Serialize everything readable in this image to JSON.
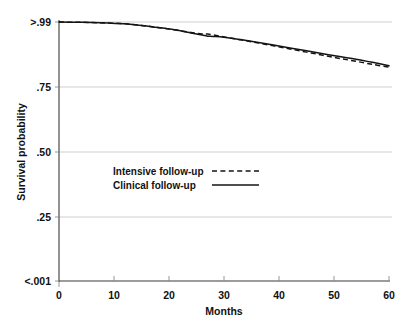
{
  "chart_data": {
    "type": "line",
    "title": "",
    "xlabel": "Months",
    "ylabel": "Survival probability",
    "xlim": [
      0,
      60
    ],
    "ylim": [
      0,
      1
    ],
    "grid": true,
    "legend_position": "center-left",
    "x_ticks": [
      "0",
      "10",
      "20",
      "30",
      "40",
      "50",
      "60"
    ],
    "x_tick_values": [
      0,
      10,
      20,
      30,
      40,
      50,
      60
    ],
    "y_ticks": [
      ">.99",
      ".75",
      ".50",
      ".25",
      "<.001"
    ],
    "y_tick_values": [
      0.99,
      0.75,
      0.5,
      0.25,
      0.001
    ],
    "series": [
      {
        "name": "Intensive follow-up",
        "style": "dashed",
        "color": "#141414",
        "x": [
          0,
          3,
          6,
          9,
          12,
          15,
          18,
          21,
          24,
          26,
          27,
          28,
          30,
          33,
          36,
          39,
          42,
          45,
          48,
          51,
          54,
          57,
          60
        ],
        "values": [
          0.99,
          0.989,
          0.988,
          0.986,
          0.983,
          0.977,
          0.969,
          0.96,
          0.95,
          0.944,
          0.944,
          0.941,
          0.933,
          0.922,
          0.911,
          0.899,
          0.887,
          0.875,
          0.863,
          0.851,
          0.84,
          0.828,
          0.818
        ]
      },
      {
        "name": "Clinical follow-up",
        "style": "solid",
        "color": "#141414",
        "x": [
          0,
          3,
          6,
          9,
          12,
          15,
          18,
          21,
          24,
          26,
          27,
          28,
          30,
          33,
          36,
          39,
          42,
          45,
          48,
          51,
          54,
          57,
          60
        ],
        "values": [
          0.99,
          0.989,
          0.988,
          0.986,
          0.983,
          0.977,
          0.969,
          0.96,
          0.948,
          0.94,
          0.936,
          0.935,
          0.932,
          0.923,
          0.913,
          0.902,
          0.891,
          0.88,
          0.869,
          0.858,
          0.848,
          0.836,
          0.823
        ]
      }
    ],
    "legend": [
      {
        "label": "Intensive follow-up",
        "style": "dashed"
      },
      {
        "label": "Clinical follow-up",
        "style": "solid"
      }
    ]
  },
  "axes": {
    "y_title": "Survival probability",
    "x_title": "Months",
    "y_tick_0": ">.99",
    "y_tick_1": ".75",
    "y_tick_2": ".50",
    "y_tick_3": ".25",
    "y_tick_4": "<.001",
    "x_tick_0": "0",
    "x_tick_1": "10",
    "x_tick_2": "20",
    "x_tick_3": "30",
    "x_tick_4": "40",
    "x_tick_5": "50",
    "x_tick_6": "60"
  },
  "legend": {
    "intensive_label": "Intensive follow-up",
    "clinical_label": "Clinical follow-up"
  },
  "colors": {
    "curve": "#141414",
    "gridline": "#c9c9c9",
    "axis": "#3a3a3a",
    "background": "#ffffff"
  }
}
